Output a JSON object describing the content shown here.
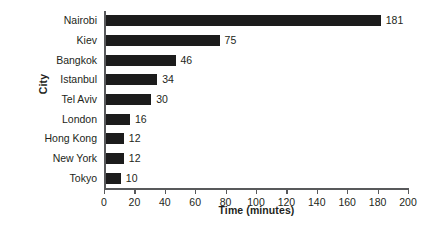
{
  "chart_data": {
    "type": "bar",
    "orientation": "horizontal",
    "title": "",
    "xlabel": "Time (minutes)",
    "ylabel": "City",
    "categories": [
      "Nairobi",
      "Kiev",
      "Bangkok",
      "Istanbul",
      "Tel Aviv",
      "London",
      "Hong Kong",
      "New York",
      "Tokyo"
    ],
    "values": [
      181,
      75,
      46,
      34,
      30,
      16,
      12,
      12,
      10
    ],
    "value_labels": [
      "181",
      "75",
      "46",
      "34",
      "30",
      "16",
      "12",
      "12",
      "10"
    ],
    "xlim": [
      0,
      200
    ],
    "xticks": [
      0,
      20,
      40,
      60,
      80,
      100,
      120,
      140,
      160,
      180,
      200
    ],
    "xtick_labels": [
      "0",
      "20",
      "40",
      "60",
      "80",
      "100",
      "120",
      "140",
      "160",
      "180",
      "200"
    ],
    "grid": false,
    "legend": false,
    "bar_color": "#1c1c1c",
    "axis_color": "#58595b",
    "background": "#ffffff",
    "text_color": "#231f20"
  }
}
